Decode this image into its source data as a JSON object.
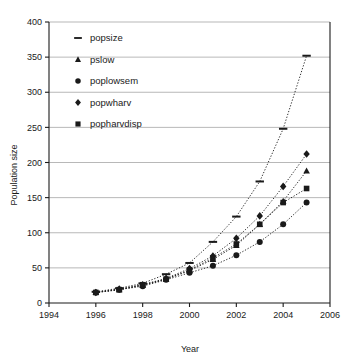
{
  "chart_data": {
    "type": "scatter",
    "title": "",
    "xlabel": "Year",
    "ylabel": "Population size",
    "xlim": [
      1994,
      2006
    ],
    "ylim": [
      0,
      400
    ],
    "xticks": [
      1994,
      1996,
      1998,
      2000,
      2002,
      2004,
      2006
    ],
    "yticks": [
      0,
      50,
      100,
      150,
      200,
      250,
      300,
      350,
      400
    ],
    "grid": "horizontal",
    "legend_position": "top-left inside plot",
    "x": [
      1996,
      1997,
      1998,
      1999,
      2000,
      2001,
      2002,
      2003,
      2004,
      2005
    ],
    "series": [
      {
        "name": "popsize",
        "marker": "dash",
        "values": [
          16,
          21,
          28,
          41,
          57,
          87,
          123,
          173,
          248,
          352
        ]
      },
      {
        "name": "pslow",
        "marker": "triangle",
        "values": [
          15,
          19,
          25,
          34,
          46,
          62,
          82,
          112,
          145,
          188
        ]
      },
      {
        "name": "poplowsem",
        "marker": "circle",
        "values": [
          15,
          19,
          24,
          33,
          43,
          53,
          68,
          87,
          112,
          143
        ]
      },
      {
        "name": "popwharv",
        "marker": "diamond",
        "values": [
          15,
          20,
          26,
          35,
          49,
          67,
          92,
          124,
          166,
          212
        ]
      },
      {
        "name": "popharvdisp",
        "marker": "square",
        "values": [
          15,
          19,
          26,
          34,
          47,
          64,
          84,
          112,
          143,
          163
        ]
      }
    ]
  },
  "legend": {
    "items": [
      {
        "label": "popsize",
        "marker": "dash"
      },
      {
        "label": "pslow",
        "marker": "triangle"
      },
      {
        "label": "poplowsem",
        "marker": "circle"
      },
      {
        "label": "popwharv",
        "marker": "diamond"
      },
      {
        "label": "popharvdisp",
        "marker": "square"
      }
    ]
  },
  "colors": {
    "ink": "#1a1a1a",
    "grid": "#9a9a9a",
    "axis": "#1a1a1a",
    "background": "#ffffff"
  }
}
